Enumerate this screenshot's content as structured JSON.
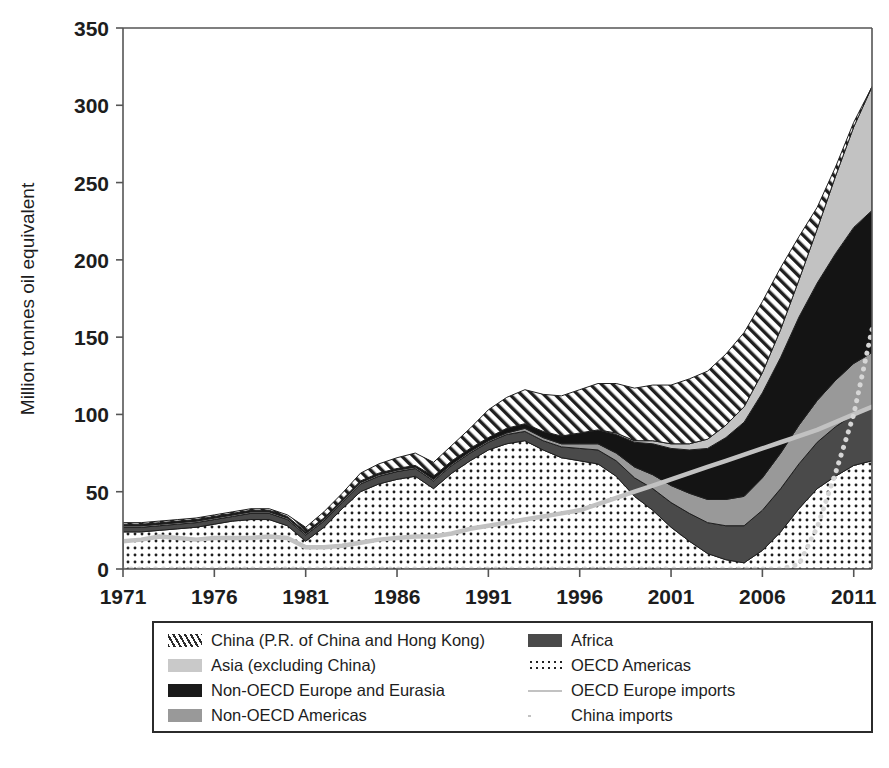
{
  "chart_data": {
    "type": "area",
    "title": "",
    "subtitle": "",
    "xlabel": "",
    "ylabel": "Million tonnes oil equivalent",
    "xlim": [
      1971,
      2012
    ],
    "ylim": [
      0,
      350
    ],
    "yticks": [
      0,
      50,
      100,
      150,
      200,
      250,
      300,
      350
    ],
    "xticks": [
      1971,
      1976,
      1981,
      1986,
      1991,
      1996,
      2001,
      2006,
      2011
    ],
    "grid": false,
    "legend_position": "below-plot",
    "stacking_order_bottom_to_top": [
      "OECD Americas",
      "Africa",
      "Non-OECD Americas",
      "Non-OECD Europe and Eurasia",
      "Asia (excluding China)",
      "China (P.R. of China and Hong Kong)"
    ],
    "x": [
      1971,
      1972,
      1973,
      1974,
      1975,
      1976,
      1977,
      1978,
      1979,
      1980,
      1981,
      1982,
      1983,
      1984,
      1985,
      1986,
      1987,
      1988,
      1989,
      1990,
      1991,
      1992,
      1993,
      1994,
      1995,
      1996,
      1997,
      1998,
      1999,
      2000,
      2001,
      2002,
      2003,
      2004,
      2005,
      2006,
      2007,
      2008,
      2009,
      2010,
      2011,
      2012
    ],
    "series": [
      {
        "name": "OECD Americas",
        "pattern": "dots",
        "color": "#ffffff",
        "values": [
          24,
          24,
          25,
          26,
          27,
          29,
          31,
          32,
          32,
          28,
          18,
          27,
          39,
          50,
          55,
          58,
          60,
          52,
          62,
          70,
          77,
          81,
          83,
          77,
          72,
          70,
          68,
          60,
          47,
          38,
          27,
          18,
          10,
          6,
          4,
          12,
          24,
          39,
          52,
          60,
          67,
          70
        ]
      },
      {
        "name": "Africa",
        "pattern": "solid",
        "color": "#4a4a4a",
        "values": [
          3,
          3,
          3,
          3,
          3,
          3,
          3,
          4,
          4,
          4,
          4,
          4,
          4,
          5,
          5,
          5,
          5,
          5,
          5,
          5,
          5,
          6,
          6,
          6,
          7,
          8,
          9,
          10,
          12,
          14,
          16,
          18,
          20,
          22,
          24,
          26,
          28,
          29,
          30,
          32,
          33,
          34
        ]
      },
      {
        "name": "Non-OECD Americas",
        "pattern": "solid",
        "color": "#999999",
        "values": [
          1,
          1,
          1,
          1,
          1,
          1,
          1,
          1,
          1,
          1,
          1,
          1,
          1,
          1,
          1,
          1,
          1,
          1,
          1,
          1,
          1,
          1,
          2,
          2,
          2,
          3,
          4,
          5,
          7,
          9,
          11,
          13,
          15,
          17,
          19,
          21,
          23,
          25,
          27,
          30,
          33,
          36
        ]
      },
      {
        "name": "Non-OECD Europe and Eurasia",
        "pattern": "solid",
        "color": "#141414",
        "values": [
          1,
          1,
          1,
          1,
          1,
          1,
          1,
          1,
          1,
          1,
          1,
          1,
          1,
          1,
          1,
          1,
          1,
          2,
          2,
          2,
          2,
          3,
          3,
          4,
          5,
          7,
          9,
          12,
          16,
          20,
          24,
          28,
          33,
          40,
          48,
          55,
          62,
          70,
          76,
          82,
          88,
          92
        ]
      },
      {
        "name": "Asia (excluding China)",
        "pattern": "solid",
        "color": "#c2c2c2",
        "values": [
          0,
          0,
          0,
          0,
          0,
          0,
          0,
          0,
          0,
          0,
          0,
          0,
          0,
          0,
          0,
          0,
          0,
          0,
          0,
          0,
          0,
          0,
          0,
          0,
          0,
          0,
          0,
          1,
          1,
          2,
          3,
          4,
          6,
          8,
          10,
          13,
          18,
          24,
          35,
          50,
          65,
          80
        ]
      },
      {
        "name": "China (P.R. of China and Hong Kong)",
        "pattern": "hatch",
        "color": "#ffffff",
        "values": [
          1,
          1,
          1,
          1,
          1,
          1,
          1,
          1,
          1,
          1,
          3,
          4,
          4,
          5,
          6,
          7,
          8,
          9,
          10,
          13,
          18,
          20,
          22,
          24,
          26,
          28,
          30,
          32,
          34,
          36,
          38,
          42,
          44,
          46,
          48,
          46,
          40,
          28,
          14,
          6,
          3,
          0
        ]
      }
    ],
    "lines": [
      {
        "name": "OECD Europe imports",
        "style": "solid",
        "color": "#c2c2c2",
        "values": [
          18,
          19,
          21,
          20,
          19,
          20,
          20,
          20,
          21,
          20,
          14,
          14,
          15,
          17,
          19,
          20,
          21,
          21,
          23,
          26,
          28,
          30,
          32,
          34,
          36,
          38,
          42,
          46,
          50,
          54,
          58,
          62,
          66,
          70,
          74,
          78,
          82,
          86,
          90,
          95,
          100,
          105
        ]
      },
      {
        "name": "China imports",
        "style": "dotted",
        "color": "#d6d6d6",
        "values": [
          0,
          0,
          0,
          0,
          0,
          0,
          0,
          0,
          0,
          0,
          0,
          0,
          0,
          0,
          0,
          0,
          0,
          0,
          0,
          0,
          0,
          0,
          0,
          0,
          0,
          0,
          0,
          0,
          0,
          0,
          0,
          0,
          0,
          0,
          0,
          0,
          0,
          3,
          27,
          62,
          100,
          155
        ]
      }
    ]
  },
  "axis": {
    "ylabel": "Million tonnes oil equivalent",
    "ytick_labels": [
      "350",
      "300",
      "250",
      "200",
      "150",
      "100",
      "50",
      "0"
    ],
    "xtick_labels": [
      "1971",
      "1976",
      "1981",
      "1986",
      "1991",
      "1996",
      "2001",
      "2006",
      "2011"
    ]
  },
  "legend": {
    "items": [
      {
        "label": "China (P.R. of China and Hong Kong)",
        "swatch": "hatch-swatch",
        "column": "left"
      },
      {
        "label": "Asia (excluding China)",
        "swatch": "light-gray-swatch",
        "column": "left"
      },
      {
        "label": "Non-OECD Europe and Eurasia",
        "swatch": "black-swatch",
        "column": "left"
      },
      {
        "label": "Non-OECD Americas",
        "swatch": "mid-gray-swatch",
        "column": "left"
      },
      {
        "label": "Africa",
        "swatch": "dark-gray-swatch",
        "column": "right"
      },
      {
        "label": "OECD Americas",
        "swatch": "dotted-swatch",
        "column": "right"
      },
      {
        "label": "OECD Europe imports",
        "swatch": "solid-line-swatch",
        "column": "right"
      },
      {
        "label": "China imports",
        "swatch": "dotted-line-swatch",
        "column": "right"
      }
    ]
  }
}
